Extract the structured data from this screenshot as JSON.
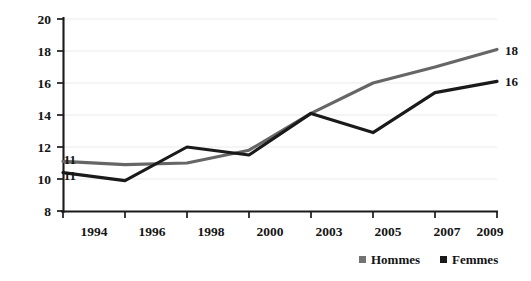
{
  "chart_data": {
    "type": "line",
    "title": "",
    "xlabel": "",
    "ylabel": "",
    "categories": [
      "1994",
      "1996",
      "1998",
      "2000",
      "2003",
      "2005",
      "2007",
      "2009"
    ],
    "ylim": [
      8,
      20
    ],
    "yticks": [
      "8",
      "10",
      "12",
      "14",
      "16",
      "18",
      "20"
    ],
    "grid": true,
    "legend_position": "bottom-right",
    "series": [
      {
        "name": "Hommes",
        "color": "#666666",
        "values": [
          11.1,
          10.9,
          11.0,
          11.8,
          14.1,
          16.0,
          17.0,
          18.1
        ],
        "start_label": "11",
        "end_label": "18"
      },
      {
        "name": "Femmes",
        "color": "#1a1a1a",
        "values": [
          10.4,
          9.9,
          12.0,
          11.5,
          14.1,
          12.9,
          15.4,
          16.1
        ],
        "start_label": "11",
        "end_label": "16"
      }
    ],
    "annotations": [
      {
        "text": "11",
        "series": "Hommes",
        "position": "left-of-first-point"
      },
      {
        "text": "11",
        "series": "Femmes",
        "position": "left-of-first-point"
      },
      {
        "text": "18",
        "series": "Hommes",
        "position": "right-of-last-point"
      },
      {
        "text": "16",
        "series": "Femmes",
        "position": "right-of-last-point"
      }
    ]
  },
  "axes": {
    "y_tick_labels": [
      "20",
      "18",
      "16",
      "14",
      "12",
      "10",
      "8"
    ],
    "x_tick_labels": [
      "1994",
      "1996",
      "1998",
      "2000",
      "2003",
      "2005",
      "2007",
      "2009"
    ]
  },
  "legend": {
    "items": [
      {
        "label": "Hommes",
        "marker_color": "#737373"
      },
      {
        "label": "Femmes",
        "marker_color": "#1a1a1a"
      }
    ]
  },
  "labels": {
    "start_hommes": "11",
    "start_femmes": "11",
    "end_hommes": "18",
    "end_femmes": "16"
  }
}
